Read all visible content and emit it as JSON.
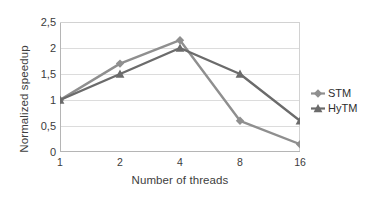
{
  "chart_data": {
    "type": "line",
    "title": "",
    "subtitle": "",
    "xlabel": "Number of threads",
    "ylabel": "Normalized speedup",
    "categories": [
      "1",
      "2",
      "4",
      "8",
      "16"
    ],
    "x": [
      1,
      2,
      4,
      8,
      16
    ],
    "series": [
      {
        "name": "STM",
        "color": "#8f8f8f",
        "marker": "diamond",
        "values": [
          1.0,
          1.7,
          2.15,
          0.6,
          0.15
        ]
      },
      {
        "name": "HyTM",
        "color": "#6b6b6b",
        "marker": "triangle",
        "values": [
          1.0,
          1.5,
          2.0,
          1.5,
          0.6
        ]
      }
    ],
    "ylim": [
      0,
      2.5
    ],
    "yticks": [
      0,
      0.5,
      1,
      1.5,
      2,
      2.5
    ],
    "ytick_labels": [
      "0",
      "0,5",
      "1",
      "1,5",
      "2",
      "2,5"
    ],
    "grid": "horizontal",
    "grid_color": "#dcdcdc",
    "legend_position": "right",
    "legend_entries": [
      "STM",
      "HyTM"
    ],
    "axis_color": "#bfbfbf",
    "background": "#ffffff"
  },
  "legend": {
    "items": [
      {
        "label": "STM"
      },
      {
        "label": "HyTM"
      }
    ]
  }
}
